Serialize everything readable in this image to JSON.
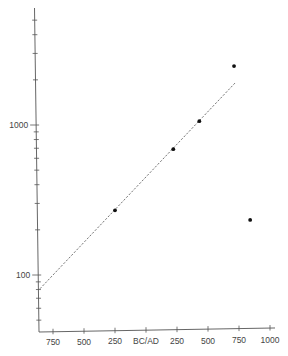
{
  "chart_data": {
    "type": "scatter",
    "title": "",
    "xlabel": "",
    "ylabel": "",
    "x_scale": "linear",
    "y_scale": "log",
    "x_ticks": [
      {
        "value": -750,
        "label": "750"
      },
      {
        "value": -500,
        "label": "500"
      },
      {
        "value": -250,
        "label": "250"
      },
      {
        "value": 0,
        "label": "BC/AD"
      },
      {
        "value": 250,
        "label": "250"
      },
      {
        "value": 500,
        "label": "500"
      },
      {
        "value": 750,
        "label": "750"
      },
      {
        "value": 1000,
        "label": "1000"
      }
    ],
    "y_labeled_ticks": [
      {
        "value": 100,
        "label": "100"
      },
      {
        "value": 1000,
        "label": "1000"
      }
    ],
    "y_minor_ticks": [
      50,
      60,
      70,
      80,
      90,
      200,
      300,
      400,
      500,
      600,
      700,
      800,
      900,
      2000,
      3000,
      4000,
      5000
    ],
    "xlim": [
      -870,
      1040
    ],
    "ylim": [
      40,
      6000
    ],
    "grid": false,
    "legend": null,
    "series": [
      {
        "name": "observations",
        "type": "scatter",
        "points": [
          {
            "x": -250,
            "y": 270
          },
          {
            "x": 220,
            "y": 690
          },
          {
            "x": 430,
            "y": 1060
          },
          {
            "x": 710,
            "y": 2470
          },
          {
            "x": 840,
            "y": 233
          }
        ]
      },
      {
        "name": "trend",
        "type": "line",
        "style": "dashed",
        "points": [
          {
            "x": -855,
            "y": 81
          },
          {
            "x": 718,
            "y": 1905
          }
        ]
      }
    ]
  },
  "style": {
    "axis_color": "#555555",
    "point_color": "#111111",
    "line_color": "#666666"
  }
}
